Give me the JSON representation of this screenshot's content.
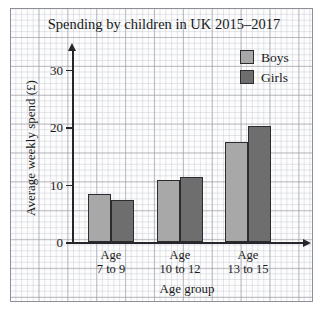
{
  "chart_data": {
    "type": "bar",
    "title": "Spending by children in UK 2015–2017",
    "xlabel": "Age group",
    "ylabel": "Average weekly spend (£)",
    "categories": [
      "Age 7 to 9",
      "Age 10 to 12",
      "Age 13 to 15"
    ],
    "category_lines": [
      {
        "line1": "Age",
        "line2": "7 to 9"
      },
      {
        "line1": "Age",
        "line2": "10 to 12"
      },
      {
        "line1": "Age",
        "line2": "13 to 15"
      }
    ],
    "series": [
      {
        "name": "Boys",
        "color": "#a8a8a8",
        "values": [
          8.5,
          10.9,
          17.4
        ]
      },
      {
        "name": "Girls",
        "color": "#6e6e6e",
        "values": [
          7.3,
          11.4,
          20.3
        ]
      }
    ],
    "ylim": [
      0,
      33
    ],
    "yticks": [
      0,
      10,
      20,
      30
    ],
    "ytick_labels": [
      "0",
      "10",
      "20",
      "30"
    ],
    "grid": true,
    "grid_style": "graph-paper",
    "legend_position": "top-right",
    "legend": [
      "Boys",
      "Girls"
    ]
  },
  "axis": {
    "y_tick_0": "0",
    "y_tick_10": "10",
    "y_tick_20": "20",
    "y_tick_30": "30"
  },
  "legend": {
    "boys_label": "Boys",
    "girls_label": "Girls",
    "boys_color": "#a8a8a8",
    "girls_color": "#6e6e6e"
  },
  "groups": {
    "g1_line1": "Age",
    "g1_line2": "7 to 9",
    "g2_line1": "Age",
    "g2_line2": "10 to 12",
    "g3_line1": "Age",
    "g3_line2": "13 to 15"
  }
}
